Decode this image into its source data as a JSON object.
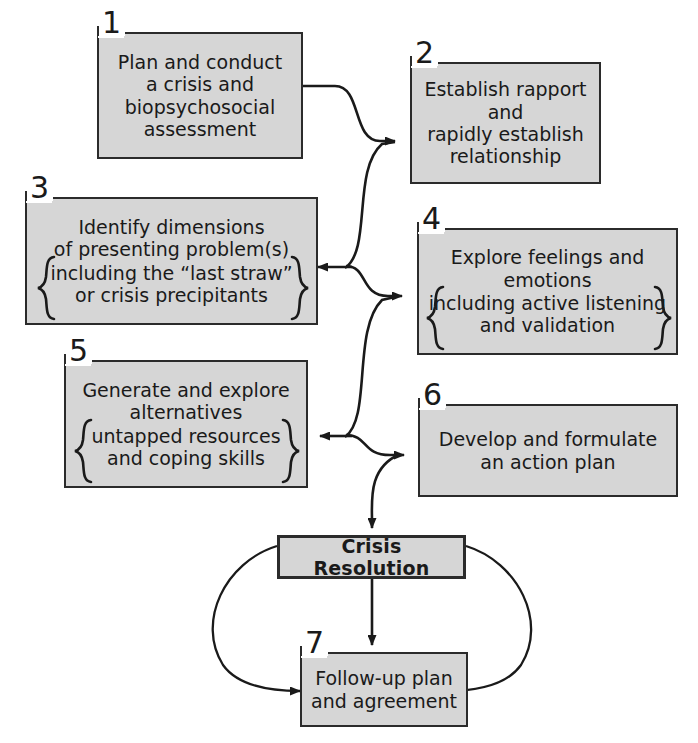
{
  "diagram": {
    "type": "flowchart",
    "palette": {
      "box_fill": "#d6d6d6",
      "box_border": "#2b2b2b",
      "text": "#1a1a1a",
      "background": "#ffffff",
      "connector": "#1a1a1a"
    },
    "nodes": [
      {
        "id": "n1",
        "number": "1",
        "text": "Plan and conduct\na crisis and\nbiopsychosocial\nassessment",
        "braced_text": "",
        "bold": false
      },
      {
        "id": "n2",
        "number": "2",
        "text": "Establish rapport\nand\nrapidly establish\nrelationship",
        "braced_text": "",
        "bold": false
      },
      {
        "id": "n3",
        "number": "3",
        "text": "Identify dimensions\nof presenting problem(s)",
        "braced_text": "including the “last straw”\nor crisis precipitants",
        "bold": false
      },
      {
        "id": "n4",
        "number": "4",
        "text": "Explore feelings and\nemotions",
        "braced_text": "including active listening\nand validation",
        "bold": false
      },
      {
        "id": "n5",
        "number": "5",
        "text": "Generate and explore\nalternatives",
        "braced_text": "untapped resources\nand coping skills",
        "bold": false
      },
      {
        "id": "n6",
        "number": "6",
        "text": "Develop and formulate\nan action plan",
        "braced_text": "",
        "bold": false
      },
      {
        "id": "nres",
        "number": "",
        "text": "Crisis Resolution",
        "braced_text": "",
        "bold": true
      },
      {
        "id": "n7",
        "number": "7",
        "text": "Follow-up plan\nand agreement",
        "braced_text": "",
        "bold": false
      }
    ],
    "connectors": [
      {
        "from": "n1",
        "to": "n2",
        "style": "curve-right"
      },
      {
        "from": "n4",
        "to": "n2",
        "style": "curve-up"
      },
      {
        "from": "n4",
        "to": "n3",
        "style": "arrow-left"
      },
      {
        "from": "n6",
        "to": "n4",
        "style": "curve-up"
      },
      {
        "from": "n6",
        "to": "n5",
        "style": "arrow-left"
      },
      {
        "from": "n6",
        "to": "nres",
        "style": "curve-down"
      },
      {
        "from": "nres",
        "to": "n7",
        "style": "arrow-down"
      },
      {
        "from": "nres",
        "to": "n7",
        "style": "loop-left"
      },
      {
        "from": "nres",
        "to": "n7",
        "style": "loop-right"
      }
    ]
  }
}
